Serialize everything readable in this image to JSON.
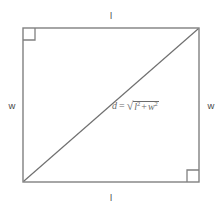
{
  "diagram": {
    "type": "geometry-figure",
    "background_color": "#ffffff",
    "stroke_color": "#808080",
    "diagonal_color": "#707070",
    "text_color": "#4a4a4a",
    "formula_color": "#6b6b6b",
    "rectangle": {
      "left": 23,
      "top": 28,
      "right": 199,
      "bottom": 182,
      "width": 176,
      "height": 154
    },
    "diagonal": {
      "from": "bottom-left",
      "to": "top-right",
      "x1": 23,
      "y1": 182,
      "x2": 199,
      "y2": 28
    },
    "right_angle_markers": [
      {
        "corner": "top-left",
        "size": 12
      },
      {
        "corner": "bottom-right",
        "size": 12
      }
    ],
    "labels": {
      "top": "l",
      "bottom": "l",
      "left": "w",
      "right": "w"
    },
    "formula": {
      "full_text": "d = √(l² + w²)",
      "variable": "d",
      "equals": "=",
      "radical_sign": "√",
      "term_one": "l",
      "term_one_exponent": "2",
      "operator": "+",
      "term_two": "w",
      "term_two_exponent": "2"
    }
  }
}
